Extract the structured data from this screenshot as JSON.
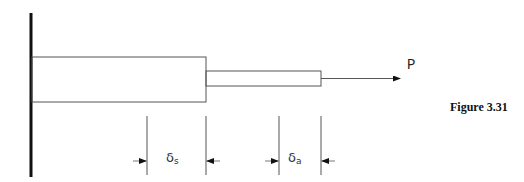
{
  "figure": {
    "caption": "Figure 3.31",
    "load_label": "P",
    "dimensions": [
      {
        "symbol": "δ",
        "subscript": "s"
      },
      {
        "symbol": "δ",
        "subscript": "a"
      }
    ]
  },
  "colors": {
    "stroke": "#555555",
    "wall": "#111111",
    "background": "#ffffff"
  }
}
